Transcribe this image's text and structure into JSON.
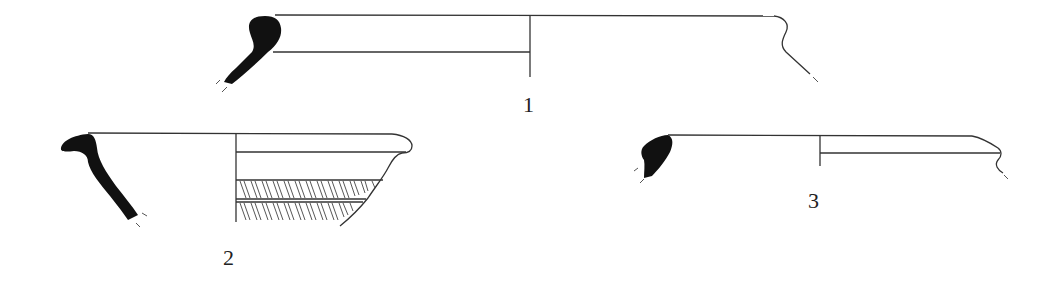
{
  "figure": {
    "type": "archaeological pottery rim profiles",
    "vessels": [
      {
        "number": "1",
        "label_pos": {
          "x": 528,
          "y": 92
        }
      },
      {
        "number": "2",
        "label_pos": {
          "x": 228,
          "y": 245
        }
      },
      {
        "number": "3",
        "label_pos": {
          "x": 813,
          "y": 188
        }
      }
    ],
    "colors": {
      "section_fill": "#111111",
      "line": "#333333",
      "background": "#ffffff"
    }
  }
}
